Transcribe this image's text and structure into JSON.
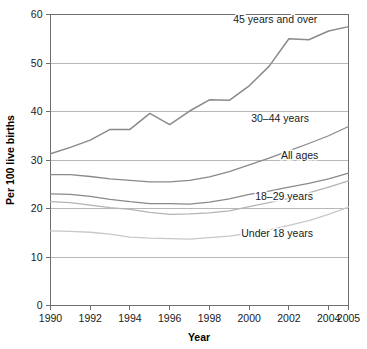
{
  "chart_data": {
    "type": "line",
    "title": "",
    "xlabel": "Year",
    "ylabel": "Per 100 live births",
    "xlim": [
      1990,
      2005
    ],
    "ylim": [
      0,
      60
    ],
    "xticks": [
      1990,
      1992,
      1994,
      1996,
      1998,
      2000,
      2002,
      2004,
      2005
    ],
    "yticks": [
      0,
      10,
      20,
      30,
      40,
      50,
      60
    ],
    "grid": "horizontal",
    "legend_position": "inline-labels",
    "x": [
      1990,
      1991,
      1992,
      1993,
      1994,
      1995,
      1996,
      1997,
      1998,
      1999,
      2000,
      2001,
      2002,
      2003,
      2004,
      2005
    ],
    "series": [
      {
        "name": "45 years and over",
        "color": "#8a8a8a",
        "width": 1.5,
        "values": [
          31.3,
          32.6,
          34.1,
          36.3,
          36.3,
          39.6,
          37.3,
          40.1,
          42.4,
          42.3,
          45.3,
          49.3,
          55.0,
          54.8,
          56.6,
          57.5
        ],
        "label_x": 1999.2,
        "label_y": 59.0,
        "label_anchor": "start"
      },
      {
        "name": "30–44 years",
        "color": "#8a8a8a",
        "width": 1.3,
        "values": [
          27.0,
          27.0,
          26.6,
          26.1,
          25.8,
          25.5,
          25.5,
          25.8,
          26.5,
          27.6,
          29.0,
          30.4,
          31.9,
          33.4,
          35.0,
          36.9
        ],
        "label_x": 2000.1,
        "label_y": 38.6,
        "label_anchor": "start"
      },
      {
        "name": "All ages",
        "color": "#8a8a8a",
        "width": 1.3,
        "values": [
          23.0,
          22.9,
          22.5,
          21.9,
          21.4,
          21.0,
          21.0,
          20.9,
          21.3,
          22.0,
          22.9,
          23.6,
          24.4,
          25.2,
          26.1,
          27.3
        ],
        "label_x": 2001.6,
        "label_y": 31.0,
        "label_anchor": "start"
      },
      {
        "name": "18–29 years",
        "color": "#b4b4b4",
        "width": 1.3,
        "values": [
          21.4,
          21.2,
          20.7,
          20.2,
          19.8,
          19.2,
          18.8,
          18.9,
          19.1,
          19.5,
          20.4,
          21.2,
          22.1,
          23.2,
          24.4,
          25.7
        ],
        "label_x": 2000.3,
        "label_y": 22.6,
        "label_anchor": "start"
      },
      {
        "name": "Under 18 years",
        "color": "#c8c8c8",
        "width": 1.3,
        "values": [
          15.4,
          15.3,
          15.1,
          14.7,
          14.1,
          13.9,
          13.8,
          13.7,
          14.0,
          14.3,
          14.9,
          15.6,
          16.5,
          17.5,
          18.8,
          20.3
        ],
        "label_x": 1999.6,
        "label_y": 15.0,
        "label_anchor": "start"
      }
    ]
  },
  "axes": {
    "x_title": "Year",
    "y_title": "Per 100 live births",
    "x_tick_labels": [
      "1990",
      "1992",
      "1994",
      "1996",
      "1998",
      "2000",
      "2002",
      "2004",
      "2005"
    ],
    "y_tick_labels": [
      "0",
      "10",
      "20",
      "30",
      "40",
      "50",
      "60"
    ]
  }
}
